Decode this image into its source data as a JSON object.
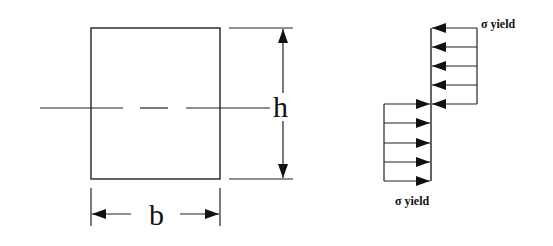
{
  "diagram": {
    "section": {
      "shape": "rectangle",
      "width_label": "b",
      "height_label": "h",
      "neutral_axis": "dashed centerline"
    },
    "stress_block": {
      "top_label": "σ yield",
      "bottom_label": "σ yield",
      "top_arrow_count": 5,
      "bottom_arrow_count": 5,
      "top_direction": "left",
      "bottom_direction": "right"
    },
    "colors": {
      "line": "#222222",
      "background": "#ffffff"
    }
  }
}
